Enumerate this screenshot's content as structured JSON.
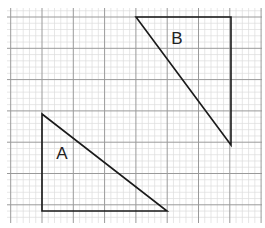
{
  "diagram": {
    "type": "grid-triangles",
    "grid": {
      "x_start": 7,
      "x_end": 262,
      "y_start": 8,
      "y_end": 223,
      "origin_x": 42,
      "origin_y": 17,
      "minor_step": 6.26,
      "minor_per_major": 5,
      "minor_color": "#dcdcdc",
      "major_color": "#9a9a9a"
    },
    "shapes": [
      {
        "name": "A",
        "label": "A",
        "label_pos": [
          62,
          159
        ],
        "points": [
          [
            42,
            114
          ],
          [
            42,
            211
          ],
          [
            167,
            211
          ]
        ]
      },
      {
        "name": "B",
        "label": "B",
        "label_pos": [
          177,
          44
        ],
        "points": [
          [
            136,
            17
          ],
          [
            231,
            17
          ],
          [
            231,
            145
          ]
        ]
      }
    ],
    "stroke_color": "#1a1a1a"
  }
}
